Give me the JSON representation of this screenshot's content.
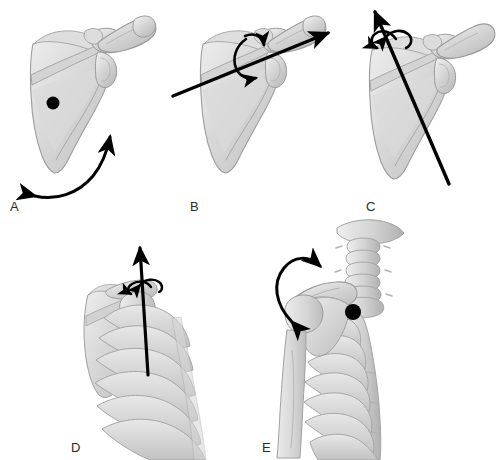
{
  "figure": {
    "background_color": "#ffffff",
    "width": 498,
    "height": 460,
    "bone_fill_light": "#e3e3e3",
    "bone_fill_mid": "#cfcfcf",
    "bone_fill_dark": "#b4b4b4",
    "bone_outline": "#9a9a9a",
    "arrow_color": "#000000",
    "marker_color": "#000000",
    "label_color": "#2b2b2b"
  },
  "panels": [
    {
      "id": "A",
      "label": "A",
      "subject": "scapula-posterior-view",
      "bones": [
        "scapula",
        "clavicle",
        "acromion",
        "coracoid-process"
      ],
      "markers": [
        {
          "type": "axis-dot",
          "name": "rotation-axis-dot",
          "x": 53,
          "y": 103,
          "r": 6.5
        }
      ],
      "arrows": [
        {
          "type": "curved-double-headed",
          "name": "upward-downward-rotation-arrow",
          "heads": 2
        }
      ]
    },
    {
      "id": "B",
      "label": "B",
      "subject": "scapula-posterior-view",
      "bones": [
        "scapula",
        "clavicle",
        "acromion",
        "coracoid-process"
      ],
      "markers": [],
      "arrows": [
        {
          "type": "straight-axis",
          "name": "oblique-axis-arrow",
          "heads": 1
        },
        {
          "type": "rotation-loop",
          "name": "axial-rotation-arrow",
          "heads": 2
        }
      ]
    },
    {
      "id": "C",
      "label": "C",
      "subject": "scapula-posterior-view",
      "bones": [
        "scapula",
        "clavicle",
        "acromion",
        "coracoid-process"
      ],
      "markers": [],
      "arrows": [
        {
          "type": "straight-axis",
          "name": "vertical-axis-arrow",
          "heads": 1
        },
        {
          "type": "rotation-arc",
          "name": "axial-rotation-arrow",
          "heads": 2
        }
      ]
    },
    {
      "id": "D",
      "label": "D",
      "subject": "thorax-with-scapula-and-humerus",
      "bones": [
        "ribs",
        "scapula",
        "humerus",
        "clavicle"
      ],
      "markers": [],
      "arrows": [
        {
          "type": "straight-axis",
          "name": "vertical-axis-arrow",
          "heads": 1
        },
        {
          "type": "rotation-arc",
          "name": "axial-rotation-arrow",
          "heads": 2
        }
      ]
    },
    {
      "id": "E",
      "label": "E",
      "subject": "thorax-cervical-spine-scapula-humerus",
      "bones": [
        "cervical-spine",
        "skull-base",
        "sternum",
        "ribs",
        "clavicle",
        "scapula",
        "humerus"
      ],
      "markers": [
        {
          "type": "axis-dot",
          "name": "rotation-axis-dot",
          "x": 353,
          "y": 312,
          "r": 8
        }
      ],
      "arrows": [
        {
          "type": "curved-double-headed",
          "name": "elevation-depression-arrow",
          "heads": 2
        }
      ]
    }
  ]
}
